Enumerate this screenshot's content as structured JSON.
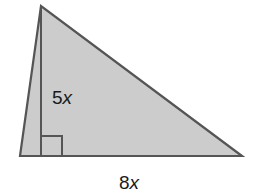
{
  "figure": {
    "shape": "triangle",
    "fill_color": "#cccccc",
    "stroke_color": "#555555",
    "vertices": {
      "apex": [
        41,
        6
      ],
      "bottom_left": [
        20,
        156
      ],
      "bottom_right": [
        242,
        156
      ]
    },
    "altitude": {
      "from": [
        41,
        6
      ],
      "to": [
        41,
        156
      ],
      "label_coefficient": "5",
      "label_variable": "x"
    },
    "base": {
      "label_coefficient": "8",
      "label_variable": "x"
    },
    "right_angle_marker": true
  }
}
